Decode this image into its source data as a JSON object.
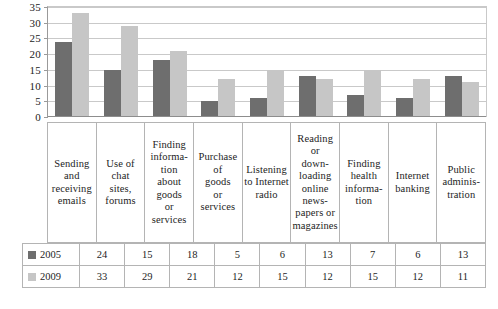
{
  "chart_data": {
    "type": "bar",
    "title": "",
    "xlabel": "",
    "ylabel": "",
    "ylim": [
      0,
      35
    ],
    "ytick_step": 5,
    "yticks": [
      35,
      30,
      25,
      20,
      15,
      10,
      5,
      0
    ],
    "grid": true,
    "legend_position": "table-left",
    "categories": [
      "Sending and receiving emails",
      "Use of chat sites, forums",
      "Finding information about goods or services",
      "Purchase of goods or services",
      "Listening to Internet radio",
      "Reading or downloading online newspapers or magazines",
      "Finding health information",
      "Internet banking",
      "Public administration"
    ],
    "category_label_lines": [
      [
        "Sending",
        "and",
        "receiving",
        "emails"
      ],
      [
        "Use of",
        "chat",
        "sites,",
        "forums"
      ],
      [
        "Finding",
        "informa-",
        "tion",
        "about",
        "goods",
        "or",
        "services"
      ],
      [
        "Purchase",
        "of",
        "goods",
        "or",
        "services"
      ],
      [
        "Listening",
        "to Internet",
        "radio"
      ],
      [
        "Reading",
        "or",
        "down-",
        "loading",
        "online",
        "news-",
        "papers or",
        "magazines"
      ],
      [
        "Finding",
        "health",
        "informa-",
        "tion"
      ],
      [
        "Internet",
        "banking"
      ],
      [
        "Public",
        "adminis-",
        "tration"
      ]
    ],
    "series": [
      {
        "name": "2005",
        "color": "#6e6e6e",
        "values": [
          24,
          15,
          18,
          5,
          6,
          13,
          7,
          6,
          13
        ]
      },
      {
        "name": "2009",
        "color": "#c6c6c6",
        "values": [
          33,
          29,
          21,
          12,
          15,
          12,
          15,
          12,
          11
        ]
      }
    ]
  },
  "colors": {
    "series_2005": "#6e6e6e",
    "series_2009": "#c6c6c6",
    "gridline": "#c9c9c9",
    "border": "#b4b4b4",
    "axis": "#8d8d8d",
    "text": "#1d1d1d",
    "background": "#ffffff"
  }
}
